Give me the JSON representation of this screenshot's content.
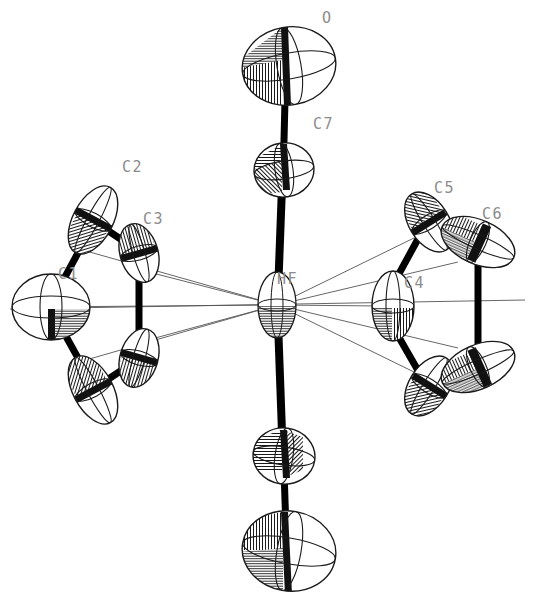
{
  "figure": {
    "type": "ortep-thermal-ellipsoid-plot",
    "title": "",
    "background_color": "#ffffff",
    "outline_color": "#1a1a1a",
    "bond_color": "#000000",
    "label_color": "#8c8c8c",
    "thin_bond_color": "#555555"
  },
  "labels": [
    {
      "id": "label-O",
      "text": "O",
      "x": 322,
      "y": 11
    },
    {
      "id": "label-C7",
      "text": "C7",
      "x": 313,
      "y": 117
    },
    {
      "id": "label-C2",
      "text": "C2",
      "x": 122,
      "y": 160
    },
    {
      "id": "label-C3",
      "text": "C3",
      "x": 143,
      "y": 212
    },
    {
      "id": "label-C5",
      "text": "C5",
      "x": 434,
      "y": 181
    },
    {
      "id": "label-C6",
      "text": "C6",
      "x": 482,
      "y": 207
    },
    {
      "id": "label-C1",
      "text": "C1",
      "x": 58,
      "y": 267
    },
    {
      "id": "label-HF",
      "text": "HF",
      "x": 277,
      "y": 272
    },
    {
      "id": "label-C4",
      "text": "C4",
      "x": 404,
      "y": 276
    }
  ],
  "atoms": [
    {
      "name": "O",
      "cx": 289,
      "cy": 66,
      "rx": 47,
      "ry": 39,
      "rot": -10,
      "kind": "large-sphere"
    },
    {
      "name": "C7",
      "cx": 284,
      "cy": 170,
      "rx": 30,
      "ry": 27,
      "rot": -8,
      "kind": "medium"
    },
    {
      "name": "HF",
      "cx": 277,
      "cy": 305,
      "rx": 19,
      "ry": 33,
      "rot": 0,
      "kind": "metal"
    },
    {
      "name": "C7a",
      "cx": 284,
      "cy": 456,
      "rx": 31,
      "ry": 28,
      "rot": 8,
      "kind": "medium"
    },
    {
      "name": "Oa",
      "cx": 289,
      "cy": 551,
      "rx": 47,
      "ry": 40,
      "rot": 10,
      "kind": "large-sphere"
    },
    {
      "name": "C1",
      "cx": 51,
      "cy": 307,
      "rx": 39,
      "ry": 33,
      "rot": 0,
      "kind": "large-sphere"
    },
    {
      "name": "C2",
      "cx": 93,
      "cy": 220,
      "rx": 37,
      "ry": 20,
      "rot": -62,
      "kind": "disc"
    },
    {
      "name": "C3",
      "cx": 139,
      "cy": 253,
      "rx": 30,
      "ry": 19,
      "rot": 74,
      "kind": "disc"
    },
    {
      "name": "C2a",
      "cx": 93,
      "cy": 390,
      "rx": 37,
      "ry": 20,
      "rot": 62,
      "kind": "disc"
    },
    {
      "name": "C3a",
      "cx": 139,
      "cy": 358,
      "rx": 30,
      "ry": 19,
      "rot": -74,
      "kind": "disc"
    },
    {
      "name": "C4",
      "cx": 393,
      "cy": 306,
      "rx": 21,
      "ry": 35,
      "rot": 0,
      "kind": "disc"
    },
    {
      "name": "C5",
      "cx": 429,
      "cy": 222,
      "rx": 33,
      "ry": 20,
      "rot": 58,
      "kind": "disc"
    },
    {
      "name": "C6",
      "cx": 478,
      "cy": 242,
      "rx": 39,
      "ry": 22,
      "rot": 24,
      "kind": "disc"
    },
    {
      "name": "C5a",
      "cx": 429,
      "cy": 386,
      "rx": 33,
      "ry": 20,
      "rot": -58,
      "kind": "disc"
    },
    {
      "name": "C6a",
      "cx": 478,
      "cy": 367,
      "rx": 39,
      "ry": 22,
      "rot": -24,
      "kind": "disc"
    }
  ],
  "bonds": [
    {
      "from": "O",
      "to": "C7",
      "style": "thick"
    },
    {
      "from": "C7",
      "to": "HF",
      "style": "thick"
    },
    {
      "from": "HF",
      "to": "C7a",
      "style": "thick"
    },
    {
      "from": "C7a",
      "to": "Oa",
      "style": "thick"
    },
    {
      "from": "C1",
      "to": "C2",
      "style": "thick"
    },
    {
      "from": "C2",
      "to": "C3",
      "style": "thick"
    },
    {
      "from": "C3",
      "to": "C3a",
      "style": "thick"
    },
    {
      "from": "C3a",
      "to": "C2a",
      "style": "thick"
    },
    {
      "from": "C2a",
      "to": "C1",
      "style": "thick"
    },
    {
      "from": "C4",
      "to": "C5",
      "style": "thick"
    },
    {
      "from": "C5",
      "to": "C6",
      "style": "thick"
    },
    {
      "from": "C6",
      "to": "C6a",
      "style": "thick"
    },
    {
      "from": "C6a",
      "to": "C5a",
      "style": "thick"
    },
    {
      "from": "C5a",
      "to": "C4",
      "style": "thick"
    },
    {
      "from": "HF",
      "to": "C1",
      "style": "thin"
    },
    {
      "from": "HF",
      "to": "C2",
      "style": "thin"
    },
    {
      "from": "HF",
      "to": "C3",
      "style": "thin"
    },
    {
      "from": "HF",
      "to": "C2a",
      "style": "thin"
    },
    {
      "from": "HF",
      "to": "C3a",
      "style": "thin"
    },
    {
      "from": "HF",
      "to": "C4",
      "style": "thin"
    },
    {
      "from": "HF",
      "to": "C5",
      "style": "thin"
    },
    {
      "from": "HF",
      "to": "C6",
      "style": "thin"
    },
    {
      "from": "HF",
      "to": "C5a",
      "style": "thin"
    },
    {
      "from": "HF",
      "to": "C6a",
      "style": "thin"
    }
  ],
  "legend": {
    "note": ""
  }
}
